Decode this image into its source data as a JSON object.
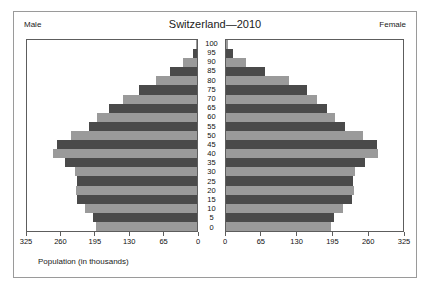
{
  "chart": {
    "title": "Switzerland—2010",
    "left_header": "Male",
    "right_header": "Female",
    "axis_caption": "Population (in thousands)"
  },
  "chart_data": {
    "type": "bar",
    "subtype": "population-pyramid",
    "title": "Switzerland—2010",
    "xlabel": "Population (in thousands)",
    "ylabel": "",
    "categories": [
      "100",
      "95",
      "90",
      "85",
      "80",
      "75",
      "70",
      "65",
      "60",
      "55",
      "50",
      "45",
      "40",
      "35",
      "30",
      "25",
      "20",
      "15",
      "10",
      "5",
      "0"
    ],
    "xlim": [
      0,
      325
    ],
    "xticks": [
      0,
      65,
      130,
      195,
      260,
      325
    ],
    "left_xticks": [
      "325",
      "260",
      "195",
      "130",
      "65",
      "0"
    ],
    "right_xticks": [
      "0",
      "65",
      "130",
      "195",
      "260",
      "325"
    ],
    "grid": false,
    "legend": [
      "Male",
      "Female"
    ],
    "legend_position": "top-corners",
    "series": [
      {
        "name": "Male",
        "values": [
          2,
          8,
          26,
          51,
          79,
          111,
          141,
          169,
          192,
          206,
          241,
          268,
          276,
          252,
          233,
          230,
          232,
          230,
          215,
          198,
          194
        ]
      },
      {
        "name": "Female",
        "values": [
          4,
          13,
          37,
          71,
          115,
          148,
          167,
          186,
          201,
          218,
          251,
          277,
          280,
          256,
          237,
          234,
          235,
          232,
          215,
          198,
          193
        ]
      }
    ],
    "colors": {
      "dark_bar": "#4a4a4a",
      "light_bar": "#9a9a9a",
      "background": "#ffffff",
      "axis": "#5d5d5d"
    }
  }
}
